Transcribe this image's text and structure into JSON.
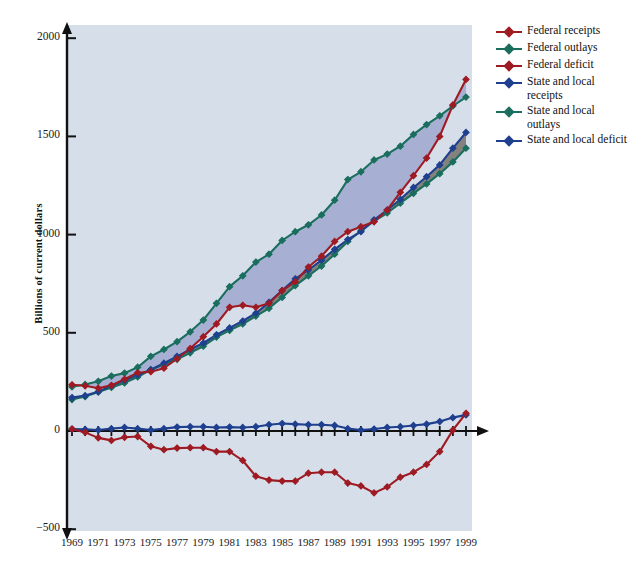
{
  "figure": {
    "background": "#ffffff",
    "plot_background": "#d6dfe9"
  },
  "axis": {
    "ylabel": "Billions of current dollars",
    "yticks": [
      2000,
      1500,
      1000,
      500,
      0,
      -500
    ],
    "ytick_labels": [
      "2000",
      "1500",
      "1000",
      "500",
      "0",
      "−500"
    ],
    "xtick_labels": [
      "1969",
      "1971",
      "1973",
      "1975",
      "1977",
      "1979",
      "1981",
      "1983",
      "1985",
      "1987",
      "1989",
      "1991",
      "1993",
      "1995",
      "1997",
      "1999"
    ]
  },
  "legend": {
    "items": [
      {
        "label": "Federal receipts",
        "color": "#9e1b24"
      },
      {
        "label": "Federal outlays",
        "color": "#1a6e5e"
      },
      {
        "label": "Federal deficit",
        "color": "#9e1b24"
      },
      {
        "label": "State and local receipts",
        "color": "#1f3f8f"
      },
      {
        "label": "State and local outlays",
        "color": "#1a6e5e"
      },
      {
        "label": "State and local deficit",
        "color": "#1f3f8f"
      }
    ]
  },
  "chart_data": {
    "type": "line",
    "title": "",
    "xlabel": "",
    "ylabel": "Billions of current dollars",
    "xlim": [
      1969,
      1999
    ],
    "ylim": [
      -500,
      2000
    ],
    "grid": false,
    "legend_position": "right",
    "x": [
      1969,
      1970,
      1971,
      1972,
      1973,
      1974,
      1975,
      1976,
      1977,
      1978,
      1979,
      1980,
      1981,
      1982,
      1983,
      1984,
      1985,
      1986,
      1987,
      1988,
      1989,
      1990,
      1991,
      1992,
      1993,
      1994,
      1995,
      1996,
      1997,
      1998,
      1999
    ],
    "series": [
      {
        "name": "Federal receipts",
        "color": "#9e1b24",
        "values": [
          235,
          230,
          218,
          232,
          263,
          297,
          302,
          320,
          368,
          420,
          480,
          545,
          630,
          640,
          630,
          650,
          715,
          760,
          835,
          890,
          965,
          1015,
          1040,
          1065,
          1125,
          1215,
          1300,
          1390,
          1500,
          1660,
          1790
        ]
      },
      {
        "name": "Federal outlays",
        "color": "#1a6e5e",
        "values": [
          225,
          237,
          253,
          280,
          295,
          325,
          380,
          415,
          455,
          505,
          565,
          650,
          735,
          790,
          860,
          900,
          970,
          1015,
          1050,
          1100,
          1175,
          1280,
          1320,
          1380,
          1410,
          1450,
          1510,
          1560,
          1605,
          1655,
          1700
        ]
      },
      {
        "name": "Federal deficit",
        "color": "#9e1b24",
        "values": [
          10,
          -7,
          -35,
          -48,
          -32,
          -28,
          -78,
          -95,
          -87,
          -85,
          -85,
          -105,
          -105,
          -150,
          -230,
          -250,
          -255,
          -255,
          -215,
          -210,
          -210,
          -265,
          -280,
          -315,
          -285,
          -235,
          -210,
          -170,
          -105,
          5,
          90
        ]
      },
      {
        "name": "State and local receipts",
        "color": "#1f3f8f",
        "values": [
          170,
          180,
          200,
          230,
          258,
          285,
          312,
          345,
          380,
          415,
          448,
          490,
          525,
          560,
          600,
          655,
          715,
          775,
          820,
          870,
          925,
          975,
          1015,
          1075,
          1125,
          1180,
          1240,
          1295,
          1355,
          1440,
          1520
        ]
      },
      {
        "name": "State and local outlays",
        "color": "#1a6e5e",
        "values": [
          160,
          175,
          198,
          222,
          245,
          275,
          312,
          338,
          365,
          398,
          432,
          478,
          512,
          545,
          585,
          625,
          680,
          740,
          790,
          840,
          900,
          965,
          1020,
          1068,
          1110,
          1160,
          1210,
          1258,
          1310,
          1370,
          1440
        ]
      },
      {
        "name": "State and local deficit",
        "color": "#1f3f8f",
        "values": [
          10,
          8,
          5,
          12,
          18,
          12,
          5,
          12,
          20,
          22,
          22,
          18,
          20,
          18,
          22,
          32,
          38,
          35,
          32,
          32,
          28,
          12,
          5,
          10,
          18,
          22,
          28,
          35,
          48,
          68,
          82
        ]
      }
    ]
  }
}
